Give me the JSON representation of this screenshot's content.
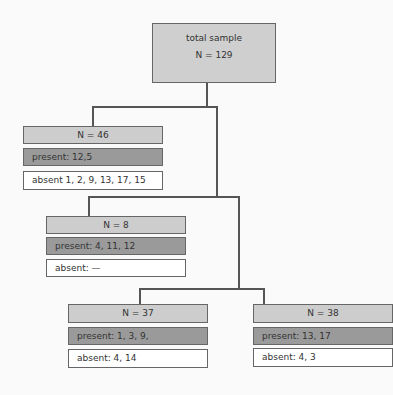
{
  "root": {
    "title": "total sample",
    "n": "N = 129"
  },
  "nodes": [
    {
      "id": "n46",
      "header": "N = 46",
      "present": "present: 12,5",
      "absent": "absent 1, 2, 9, 13, 17, 15"
    },
    {
      "id": "n8",
      "header": "N = 8",
      "present": "present: 4, 11, 12",
      "absent": "absent: —"
    },
    {
      "id": "n37",
      "header": "N = 37",
      "present": "present: 1, 3, 9,",
      "absent": "absent: 4, 14"
    },
    {
      "id": "n38",
      "header": "N = 38",
      "present": "present: 13, 17",
      "absent": "absent: 4, 3"
    }
  ],
  "colors": {
    "header": "#cdcdcd",
    "present": "#9a9a9a",
    "absent": "#ffffff",
    "line": "#555555"
  }
}
